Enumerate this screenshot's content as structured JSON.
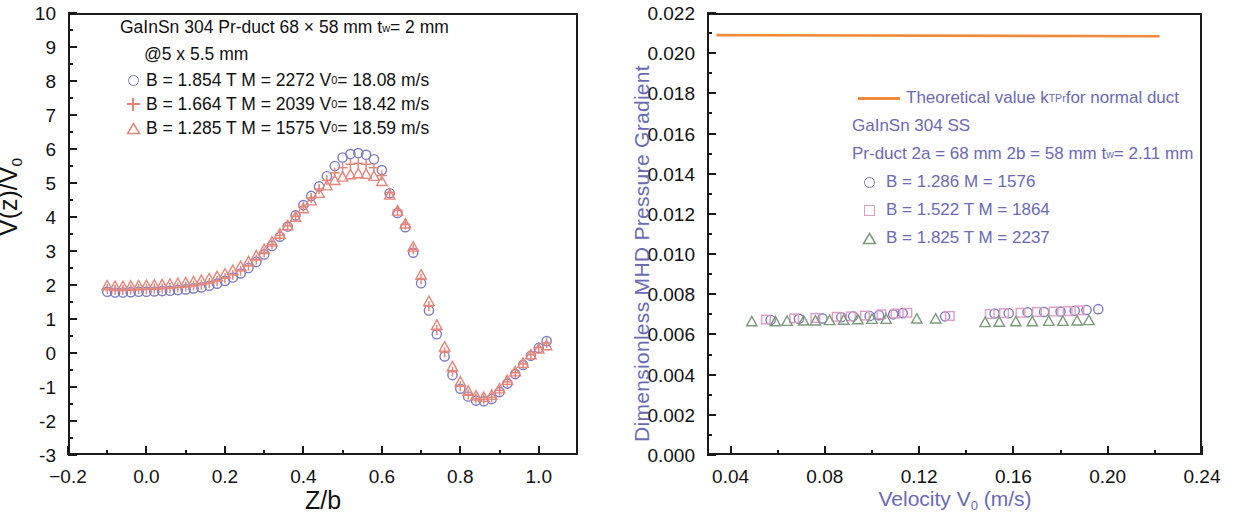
{
  "figure": {
    "colors": {
      "series_blue": "#7b7bc4",
      "series_salmon": "#e4867a",
      "series_pink": "#e39ac4",
      "series_green": "#7d9a7d",
      "theory_orange": "#f08a3c",
      "axis_black": "#1a1a1a",
      "right_label_purple": "#6a6ab5"
    }
  },
  "left_panel": {
    "legend": {
      "header1": "GaInSn  304 Pr-duct 68 × 58 mm   t",
      "header1_sub": "w",
      "header1_tail": " = 2 mm",
      "header2": "@5 x 5.5 mm",
      "entries": [
        {
          "marker": "circle",
          "text_a": "B = 1.854 T  M = 2272  V",
          "sub": "0",
          "text_b": " = 18.08 m/s"
        },
        {
          "marker": "plus",
          "text_a": "B = 1.664 T  M = 2039  V",
          "sub": "0",
          "text_b": " = 18.42 m/s"
        },
        {
          "marker": "triangle",
          "text_a": "B = 1.285 T  M = 1575  V",
          "sub": "0",
          "text_b": " = 18.59 m/s"
        }
      ]
    },
    "ytitle_a": "V(z)/V",
    "ytitle_sub": "0",
    "xtitle": "Z/b",
    "yticks": [
      "10",
      "9",
      "8",
      "7",
      "6",
      "5",
      "4",
      "3",
      "2",
      "1",
      "0",
      "-1",
      "-2",
      "-3"
    ],
    "xticks": [
      "−0.2",
      "0.0",
      "0.2",
      "0.4",
      "0.6",
      "0.8",
      "1.0"
    ]
  },
  "right_panel": {
    "legend": {
      "theory_label_a": "Theoretical value k",
      "theory_label_sub": "TPr",
      "theory_label_b": " for normal duct",
      "line1": "GaInSn 304 SS",
      "line2_a": "Pr-duct  2a = 68 mm   2b = 58 mm   t",
      "line2_sub": "w",
      "line2_b": " = 2.11 mm",
      "entries": [
        {
          "marker": "circle",
          "text": "B = 1.286      M = 1576"
        },
        {
          "marker": "square",
          "text": "B = 1.522 T  M = 1864"
        },
        {
          "marker": "triangle",
          "text": "B = 1.825 T  M = 2237"
        }
      ]
    },
    "ytitle": "Dimensionless MHD Pressure  Gradient",
    "xtitle_a": "Velocity V",
    "xtitle_sub": "0",
    "xtitle_b": "  (m/s)",
    "yticks": [
      "0.022",
      "0.020",
      "0.018",
      "0.016",
      "0.014",
      "0.012",
      "0.010",
      "0.008",
      "0.006",
      "0.004",
      "0.002",
      "0.000"
    ],
    "xticks": [
      "0.04",
      "0.08",
      "0.12",
      "0.16",
      "0.20",
      "0.24"
    ]
  },
  "chart_data": [
    {
      "type": "scatter",
      "panel": "left",
      "title": "",
      "xlabel": "Z/b",
      "ylabel": "V(z)/V0",
      "xlim": [
        -0.2,
        1.1
      ],
      "ylim": [
        -3,
        10
      ],
      "grid": false,
      "legend_position": "upper-left-inside",
      "series": [
        {
          "name": "B = 1.854 T  M = 2272  V0 = 18.08 m/s",
          "marker": "circle",
          "color": "#7b7bc4",
          "x": [
            -0.1,
            -0.08,
            -0.06,
            -0.04,
            -0.02,
            0.0,
            0.02,
            0.04,
            0.06,
            0.08,
            0.1,
            0.12,
            0.14,
            0.16,
            0.18,
            0.2,
            0.22,
            0.24,
            0.26,
            0.28,
            0.3,
            0.32,
            0.34,
            0.36,
            0.38,
            0.4,
            0.42,
            0.44,
            0.46,
            0.48,
            0.5,
            0.52,
            0.54,
            0.56,
            0.58,
            0.6,
            0.62,
            0.64,
            0.66,
            0.68,
            0.7,
            0.72,
            0.74,
            0.76,
            0.78,
            0.8,
            0.82,
            0.84,
            0.86,
            0.88,
            0.9,
            0.92,
            0.94,
            0.96,
            0.98,
            1.0,
            1.02
          ],
          "y": [
            1.8,
            1.78,
            1.78,
            1.79,
            1.8,
            1.8,
            1.81,
            1.82,
            1.83,
            1.85,
            1.87,
            1.9,
            1.93,
            1.98,
            2.04,
            2.12,
            2.22,
            2.34,
            2.5,
            2.68,
            2.9,
            3.15,
            3.42,
            3.72,
            4.05,
            4.35,
            4.62,
            4.9,
            5.2,
            5.5,
            5.75,
            5.85,
            5.88,
            5.83,
            5.7,
            5.38,
            4.7,
            4.12,
            3.7,
            2.95,
            2.05,
            1.25,
            0.55,
            -0.1,
            -0.65,
            -1.05,
            -1.28,
            -1.4,
            -1.42,
            -1.35,
            -1.15,
            -0.9,
            -0.62,
            -0.35,
            -0.08,
            0.15,
            0.35
          ]
        },
        {
          "name": "B = 1.664 T  M = 2039  V0 = 18.42 m/s",
          "marker": "plus",
          "color": "#e4867a",
          "x": [
            -0.1,
            -0.08,
            -0.06,
            -0.04,
            -0.02,
            0.0,
            0.02,
            0.04,
            0.06,
            0.08,
            0.1,
            0.12,
            0.14,
            0.16,
            0.18,
            0.2,
            0.22,
            0.24,
            0.26,
            0.28,
            0.3,
            0.32,
            0.34,
            0.36,
            0.38,
            0.4,
            0.42,
            0.44,
            0.46,
            0.48,
            0.5,
            0.52,
            0.54,
            0.56,
            0.58,
            0.6,
            0.62,
            0.64,
            0.66,
            0.68,
            0.7,
            0.72,
            0.74,
            0.76,
            0.78,
            0.8,
            0.82,
            0.84,
            0.86,
            0.88,
            0.9,
            0.92,
            0.94,
            0.96,
            0.98,
            1.0,
            1.02
          ],
          "y": [
            1.88,
            1.86,
            1.86,
            1.87,
            1.88,
            1.88,
            1.89,
            1.9,
            1.91,
            1.93,
            1.95,
            1.98,
            2.01,
            2.06,
            2.12,
            2.2,
            2.3,
            2.42,
            2.57,
            2.75,
            2.96,
            3.2,
            3.46,
            3.74,
            4.02,
            4.3,
            4.56,
            4.82,
            5.08,
            5.3,
            5.45,
            5.55,
            5.58,
            5.55,
            5.45,
            5.22,
            4.72,
            4.2,
            3.78,
            3.05,
            2.18,
            1.38,
            0.68,
            0.02,
            -0.55,
            -0.98,
            -1.22,
            -1.34,
            -1.36,
            -1.3,
            -1.1,
            -0.85,
            -0.58,
            -0.32,
            -0.05,
            0.16,
            0.3
          ]
        },
        {
          "name": "B = 1.285 T  M = 1575  V0 = 18.59 m/s",
          "marker": "triangle",
          "color": "#e4867a",
          "x": [
            -0.1,
            -0.08,
            -0.06,
            -0.04,
            -0.02,
            0.0,
            0.02,
            0.04,
            0.06,
            0.08,
            0.1,
            0.12,
            0.14,
            0.16,
            0.18,
            0.2,
            0.22,
            0.24,
            0.26,
            0.28,
            0.3,
            0.32,
            0.34,
            0.36,
            0.38,
            0.4,
            0.42,
            0.44,
            0.46,
            0.48,
            0.5,
            0.52,
            0.54,
            0.56,
            0.58,
            0.6,
            0.62,
            0.64,
            0.66,
            0.68,
            0.7,
            0.72,
            0.74,
            0.76,
            0.78,
            0.8,
            0.82,
            0.84,
            0.86,
            0.88,
            0.9,
            0.92,
            0.94,
            0.96,
            0.98,
            1.0,
            1.02
          ],
          "y": [
            1.98,
            1.96,
            1.96,
            1.97,
            1.98,
            1.99,
            2.0,
            2.01,
            2.03,
            2.05,
            2.07,
            2.1,
            2.14,
            2.19,
            2.25,
            2.33,
            2.43,
            2.55,
            2.69,
            2.86,
            3.05,
            3.27,
            3.5,
            3.75,
            4.0,
            4.25,
            4.48,
            4.7,
            4.92,
            5.08,
            5.18,
            5.25,
            5.28,
            5.26,
            5.2,
            5.05,
            4.65,
            4.18,
            3.8,
            3.12,
            2.3,
            1.52,
            0.82,
            0.18,
            -0.4,
            -0.85,
            -1.12,
            -1.26,
            -1.3,
            -1.24,
            -1.05,
            -0.8,
            -0.55,
            -0.3,
            -0.05,
            0.12,
            0.22
          ]
        }
      ]
    },
    {
      "type": "scatter",
      "panel": "right",
      "title": "",
      "xlabel": "Velocity V0 (m/s)",
      "ylabel": "Dimensionless MHD Pressure Gradient",
      "xlim": [
        0.03,
        0.24
      ],
      "ylim": [
        0.0,
        0.022
      ],
      "grid": false,
      "legend_position": "upper-right-inside",
      "theory_line": {
        "name": "Theoretical value kTPr for normal duct",
        "color": "#f08a3c",
        "value": 0.0209,
        "x_start": 0.034,
        "x_end": 0.222
      },
      "series": [
        {
          "name": "B = 1.286  M = 1576",
          "marker": "circle",
          "color": "#7b7bc4",
          "x": [
            0.057,
            0.069,
            0.079,
            0.087,
            0.092,
            0.099,
            0.103,
            0.109,
            0.113,
            0.131,
            0.152,
            0.158,
            0.166,
            0.173,
            0.18,
            0.186,
            0.191,
            0.196
          ],
          "y": [
            0.00672,
            0.00678,
            0.0068,
            0.00686,
            0.0069,
            0.00692,
            0.00696,
            0.007,
            0.00706,
            0.0069,
            0.00704,
            0.00706,
            0.0071,
            0.00712,
            0.00714,
            0.00718,
            0.00722,
            0.00726
          ]
        },
        {
          "name": "B = 1.522 T  M = 1864",
          "marker": "square",
          "color": "#e39ac4",
          "x": [
            0.055,
            0.067,
            0.076,
            0.085,
            0.091,
            0.097,
            0.104,
            0.11,
            0.115,
            0.133,
            0.15,
            0.156,
            0.163,
            0.17,
            0.177,
            0.183,
            0.188
          ],
          "y": [
            0.00674,
            0.0068,
            0.00682,
            0.00688,
            0.0069,
            0.00694,
            0.007,
            0.00704,
            0.00708,
            0.00692,
            0.00702,
            0.00706,
            0.00708,
            0.00712,
            0.00714,
            0.00716,
            0.0072
          ]
        },
        {
          "name": "B = 1.825 T  M = 2237",
          "marker": "triangle",
          "color": "#7d9a7d",
          "x": [
            0.049,
            0.059,
            0.064,
            0.071,
            0.076,
            0.082,
            0.088,
            0.094,
            0.1,
            0.106,
            0.119,
            0.127,
            0.148,
            0.154,
            0.161,
            0.168,
            0.175,
            0.181,
            0.187,
            0.192
          ],
          "y": [
            0.00664,
            0.00664,
            0.00666,
            0.00668,
            0.00668,
            0.0067,
            0.00672,
            0.00674,
            0.00676,
            0.00676,
            0.00678,
            0.00678,
            0.0066,
            0.00662,
            0.00664,
            0.00664,
            0.00666,
            0.00666,
            0.00668,
            0.0067
          ]
        }
      ]
    }
  ]
}
